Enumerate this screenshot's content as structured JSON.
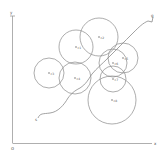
{
  "diagram": {
    "type": "path-planning-with-circular-obstacles",
    "colors": {
      "background": "#ffffff",
      "stroke": "#8a8a8a",
      "axis": "#9a9a9a",
      "label": "#555555"
    },
    "axes": {
      "origin_label": "o",
      "x_label": "x",
      "y_label": "y"
    },
    "start_label": "s",
    "goal_label": "g",
    "obstacles": [
      {
        "id": "c1",
        "label": "c1",
        "cx": 76,
        "cy": 47,
        "r": 17
      },
      {
        "id": "c2",
        "label": "c2",
        "cx": 99,
        "cy": 37,
        "r": 19
      },
      {
        "id": "c3",
        "label": "c3",
        "cx": 49,
        "cy": 73,
        "r": 15
      },
      {
        "id": "c4",
        "label": "c4",
        "cx": 75,
        "cy": 78,
        "r": 16
      },
      {
        "id": "c5",
        "label": "c5",
        "cx": 123,
        "cy": 58,
        "r": 15
      },
      {
        "id": "c6",
        "label": "c6",
        "cx": 113,
        "cy": 63,
        "r": 14
      },
      {
        "id": "c7",
        "label": "c7",
        "cx": 113,
        "cy": 79,
        "r": 13
      },
      {
        "id": "c8",
        "label": "c8",
        "cx": 112,
        "cy": 100,
        "r": 24
      }
    ]
  }
}
